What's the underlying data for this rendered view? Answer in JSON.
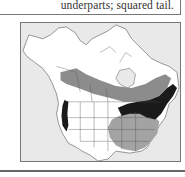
{
  "description": {
    "text": "underparts; squared tail."
  },
  "range_map": {
    "region": "North America",
    "legend_colors": {
      "ocean": "#e9e9e9",
      "land": "#ffffff",
      "breeding": "#8c8c8c",
      "winter": "#a3a3a3",
      "year_round": "#1a1a1a",
      "borders": "#555555"
    }
  }
}
